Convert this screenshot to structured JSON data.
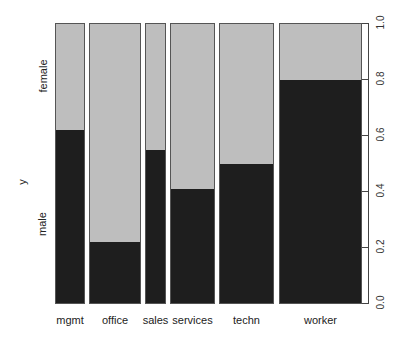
{
  "chart_data": {
    "type": "bar",
    "subtype": "spineplot",
    "title": "",
    "xlabel": "",
    "ylabel": "y",
    "categories": [
      "mgmt",
      "office",
      "sales",
      "services",
      "techn",
      "worker"
    ],
    "widths_px": [
      30,
      52,
      21,
      45,
      55,
      83
    ],
    "series": [
      {
        "name": "male",
        "values": [
          0.62,
          0.22,
          0.55,
          0.41,
          0.5,
          0.8
        ],
        "color": "#1e1e1e"
      },
      {
        "name": "female",
        "values": [
          0.38,
          0.78,
          0.45,
          0.59,
          0.5,
          0.2
        ],
        "color": "#bebebe"
      }
    ],
    "left_axis_labels": [
      "male",
      "female"
    ],
    "right_axis_ticks": [
      "0.0",
      "0.2",
      "0.4",
      "0.6",
      "0.8",
      "1.0"
    ],
    "ylim": [
      0,
      1
    ],
    "grid": false,
    "legend": "none"
  }
}
